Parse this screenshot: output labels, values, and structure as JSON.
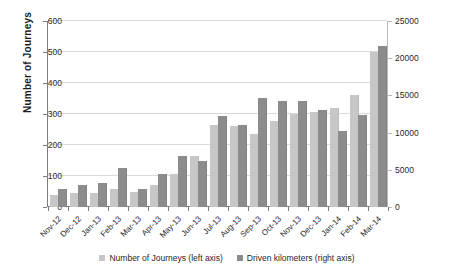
{
  "chart_data": {
    "type": "bar",
    "title": "",
    "subtitle": "",
    "xlabel": "",
    "ylabel": "Number of Journeys",
    "ylabel_right": "",
    "categories": [
      "Nov-12",
      "Dec-12",
      "Jan-13",
      "Feb-13",
      "Mar-13",
      "Apr-13",
      "May-13",
      "Jun-13",
      "Jul-13",
      "Aug-13",
      "Sep-13",
      "Oct-13",
      "Nov-13",
      "Dec-13",
      "Jan-14",
      "Feb-14",
      "Mar-14"
    ],
    "series": [
      {
        "name": "Number of Journeys (left axis)",
        "axis": "left",
        "color": "#c7c7c7",
        "values": [
          40,
          46,
          44,
          57,
          48,
          70,
          108,
          165,
          266,
          261,
          236,
          277,
          300,
          308,
          318,
          360,
          500
        ]
      },
      {
        "name": "Driven kilometers (right axis)",
        "axis": "right",
        "color": "#8c8c8c",
        "values": [
          2400,
          2900,
          3200,
          5200,
          2400,
          4400,
          6900,
          6200,
          12200,
          11000,
          14700,
          14300,
          14250,
          13100,
          10150,
          12400,
          21600
        ]
      }
    ],
    "ylim": [
      0,
      600
    ],
    "yticks": [
      0,
      100,
      200,
      300,
      400,
      500,
      600
    ],
    "ylim_right": [
      0,
      25000
    ],
    "yticks_right": [
      0,
      5000,
      10000,
      15000,
      20000,
      25000
    ],
    "grid": true,
    "legend_position": "bottom",
    "legend": [
      "Number of Journeys (left axis)",
      "Driven kilometers (right axis)"
    ]
  }
}
